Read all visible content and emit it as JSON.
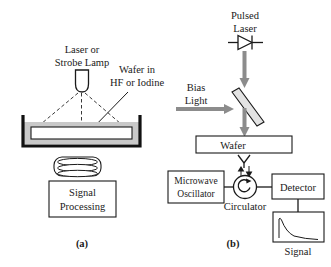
{
  "figure": {
    "panels": [
      {
        "id": "a",
        "caption": "(a)",
        "labels": {
          "source": "Laser or\nStrobe Lamp",
          "source_line1": "Laser or",
          "source_line2": "Strobe Lamp",
          "sample": "Wafer in\nHF or Iodine",
          "sample_line1": "Wafer in",
          "sample_line2": "HF or Iodine",
          "processor_line1": "Signal",
          "processor_line2": "Processing"
        },
        "components": [
          "laser-strobe-lamp",
          "illumination-rays",
          "etch-bath-vessel",
          "wafer-in-solution",
          "camera-detector",
          "signal-processing-box"
        ]
      },
      {
        "id": "b",
        "caption": "(b)",
        "labels": {
          "pulsed_laser_line1": "Pulsed",
          "pulsed_laser_line2": "Laser",
          "bias_light_line1": "Bias",
          "bias_light_line2": "Light",
          "wafer": "Wafer",
          "microwave_oscillator_line1": "Microwave",
          "microwave_oscillator_line2": "Oscillator",
          "circulator": "Circulator",
          "detector": "Detector",
          "signal": "Signal"
        },
        "components": [
          "laser-diode-symbol",
          "laser-beam",
          "bias-light-beam",
          "beam-splitter",
          "wafer-box",
          "antenna",
          "microwave-waveguide-arrows",
          "circulator-circle",
          "microwave-oscillator-box",
          "detector-box",
          "signal-waveform-box"
        ],
        "signal_waveform": {
          "description": "sharp rise then exponential decay",
          "type": "line"
        }
      }
    ],
    "colors": {
      "ink": "#1a1a1a",
      "fluid_gray": "#c9c9c9",
      "beam_gray": "#8c8c8c",
      "splitter_gray": "#e3e3e3",
      "background": "#ffffff"
    }
  }
}
